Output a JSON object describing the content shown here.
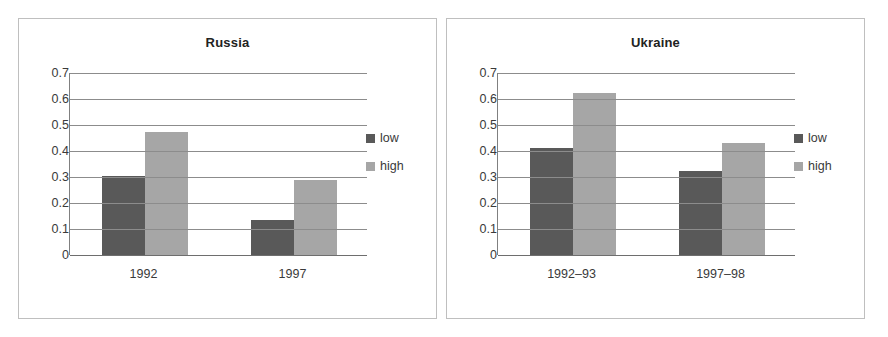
{
  "chart_data": [
    {
      "type": "bar",
      "title": "Russia",
      "categories": [
        "1992",
        "1997"
      ],
      "series": [
        {
          "name": "low",
          "values": [
            0.305,
            0.135
          ],
          "color": "#595959"
        },
        {
          "name": "high",
          "values": [
            0.475,
            0.29
          ],
          "color": "#a6a6a6"
        }
      ],
      "xlabel": "",
      "ylabel": "",
      "ylim": [
        0,
        0.7
      ],
      "yticks": [
        "0.7",
        "0.6",
        "0.5",
        "0.4",
        "0.3",
        "0.2",
        "0.1",
        "0"
      ],
      "ytick_values": [
        0.7,
        0.6,
        0.5,
        0.4,
        0.3,
        0.2,
        0.1,
        0
      ],
      "grid": "horizontal",
      "legend_position": "right",
      "legend": [
        "low",
        "high"
      ]
    },
    {
      "type": "bar",
      "title": "Ukraine",
      "categories": [
        "1992–93",
        "1997–98"
      ],
      "series": [
        {
          "name": "low",
          "values": [
            0.41,
            0.325
          ],
          "color": "#595959"
        },
        {
          "name": "high",
          "values": [
            0.625,
            0.43
          ],
          "color": "#a6a6a6"
        }
      ],
      "xlabel": "",
      "ylabel": "",
      "ylim": [
        0,
        0.7
      ],
      "yticks": [
        "0.7",
        "0.6",
        "0.5",
        "0.4",
        "0.3",
        "0.2",
        "0.1",
        "0"
      ],
      "ytick_values": [
        0.7,
        0.6,
        0.5,
        0.4,
        0.3,
        0.2,
        0.1,
        0
      ],
      "grid": "horizontal",
      "legend_position": "right",
      "legend": [
        "low",
        "high"
      ]
    }
  ],
  "colors": {
    "low": "#595959",
    "high": "#a6a6a6",
    "gridline": "#8c8c8c",
    "panel_border": "#bfbfbf",
    "text": "#3a3a3a",
    "title": "#222222",
    "background": "#ffffff"
  }
}
